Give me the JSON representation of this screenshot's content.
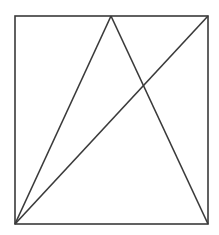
{
  "diagram": {
    "background": "#ffffff",
    "stroke_color": "#3a3a3a",
    "stroke_width": 1.6,
    "rectangle": {
      "x": 15,
      "y": 16,
      "width": 193,
      "height": 208
    },
    "points": {
      "top_left": [
        15,
        16
      ],
      "top_right": [
        208,
        16
      ],
      "bottom_left": [
        15,
        224
      ],
      "bottom_right": [
        208,
        224
      ],
      "top_apex": [
        111,
        16
      ]
    },
    "lines": [
      {
        "name": "apex-to-bottom-left",
        "from": [
          111,
          16
        ],
        "to": [
          15,
          224
        ]
      },
      {
        "name": "apex-to-bottom-right",
        "from": [
          111,
          16
        ],
        "to": [
          208,
          224
        ]
      },
      {
        "name": "diagonal-bottom-left-to-top-right",
        "from": [
          15,
          224
        ],
        "to": [
          208,
          16
        ]
      }
    ]
  }
}
